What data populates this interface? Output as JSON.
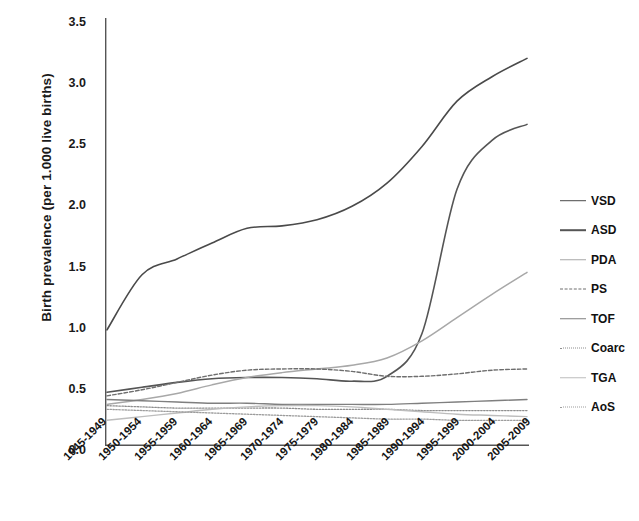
{
  "chart_data": {
    "type": "line",
    "title": "",
    "xlabel": "",
    "ylabel": "Birth prevalence (per 1.000 live births)",
    "ylim": [
      0.0,
      3.5
    ],
    "yticks": [
      "3.5",
      "3.0",
      "2.5",
      "2.0",
      "1.5",
      "1.0",
      "0.5",
      "0.0"
    ],
    "ytick_values": [
      3.5,
      3.0,
      2.5,
      2.0,
      1.5,
      1.0,
      0.5,
      0.0
    ],
    "grid": false,
    "legend_position": "right",
    "categories": [
      "1945-1949",
      "1950-1954",
      "1955-1959",
      "1960-1964",
      "1965-1969",
      "1970-1974",
      "1975-1979",
      "1980-1984",
      "1985-1989",
      "1990-1994",
      "1995-1999",
      "2000-2004",
      "2005-2009"
    ],
    "series": [
      {
        "name": "VSD",
        "color": "#4a4a4a",
        "style": "solid",
        "width": 1.6,
        "values": [
          0.95,
          1.4,
          1.53,
          1.66,
          1.78,
          1.8,
          1.85,
          1.96,
          2.15,
          2.45,
          2.82,
          3.02,
          3.17
        ]
      },
      {
        "name": "ASD",
        "color": "#555555",
        "style": "solid",
        "width": 1.6,
        "values": [
          0.44,
          0.48,
          0.52,
          0.55,
          0.56,
          0.56,
          0.55,
          0.53,
          0.57,
          0.92,
          2.1,
          2.5,
          2.63
        ]
      },
      {
        "name": "PDA",
        "color": "#a8a8a8",
        "style": "solid",
        "width": 1.5,
        "values": [
          0.34,
          0.38,
          0.43,
          0.5,
          0.56,
          0.6,
          0.63,
          0.66,
          0.72,
          0.86,
          1.05,
          1.24,
          1.42
        ]
      },
      {
        "name": "PS",
        "color": "#6e6e6e",
        "style": "dashed",
        "width": 1.4,
        "values": [
          0.41,
          0.46,
          0.52,
          0.58,
          0.62,
          0.63,
          0.63,
          0.61,
          0.57,
          0.57,
          0.59,
          0.62,
          0.63
        ]
      },
      {
        "name": "TOF",
        "color": "#7f7f7f",
        "style": "solid",
        "width": 1.4,
        "values": [
          0.38,
          0.37,
          0.36,
          0.35,
          0.35,
          0.34,
          0.34,
          0.34,
          0.34,
          0.35,
          0.36,
          0.37,
          0.38
        ]
      },
      {
        "name": "Coarc",
        "color": "#8e8e8e",
        "style": "dotted",
        "width": 1.3,
        "values": [
          0.33,
          0.32,
          0.31,
          0.31,
          0.31,
          0.31,
          0.3,
          0.3,
          0.3,
          0.29,
          0.29,
          0.29,
          0.29
        ]
      },
      {
        "name": "TGA",
        "color": "#bdbdbd",
        "style": "solid",
        "width": 1.4,
        "values": [
          0.21,
          0.24,
          0.27,
          0.3,
          0.32,
          0.33,
          0.33,
          0.32,
          0.3,
          0.28,
          0.26,
          0.25,
          0.24
        ]
      },
      {
        "name": "AoS",
        "color": "#9c9c9c",
        "style": "dotted",
        "width": 1.3,
        "values": [
          0.3,
          0.29,
          0.28,
          0.27,
          0.26,
          0.25,
          0.24,
          0.23,
          0.22,
          0.22,
          0.21,
          0.21,
          0.21
        ]
      }
    ]
  },
  "axes": {
    "axis_color": "#555555",
    "text_color": "#111111"
  }
}
